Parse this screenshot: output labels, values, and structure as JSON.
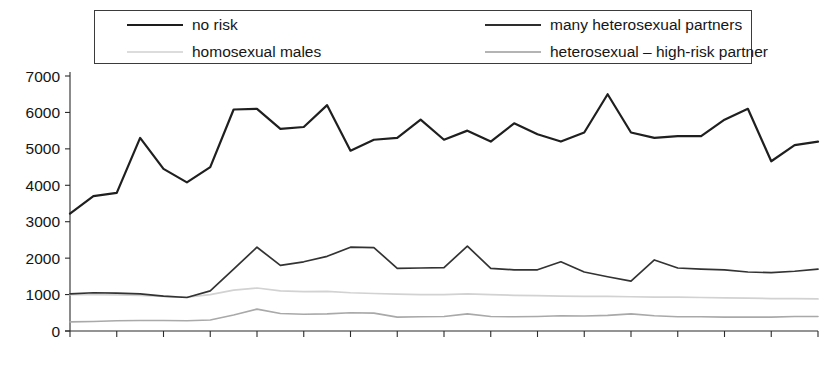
{
  "legend": {
    "items": [
      {
        "label": "no risk",
        "key": "no_risk",
        "color": "#1f1f1f"
      },
      {
        "label": "many heterosexual partners",
        "key": "many_het",
        "color": "#333333"
      },
      {
        "label": "homosexual males",
        "key": "homosexual_males",
        "color": "#d2d2d2"
      },
      {
        "label": "heterosexual – high-risk partner",
        "key": "het_high_risk",
        "color": "#a9a9a9"
      }
    ]
  },
  "chart_data": {
    "type": "line",
    "title": "",
    "xlabel": "",
    "ylabel": "",
    "ylim": [
      0,
      7000
    ],
    "ytick_labels": [
      "0",
      "1000",
      "2000",
      "3000",
      "4000",
      "5000",
      "6000",
      "7000"
    ],
    "yticks": [
      0,
      1000,
      2000,
      3000,
      4000,
      5000,
      6000,
      7000
    ],
    "grid": false,
    "legend_position": "top",
    "categories": [
      "2 89",
      "3 89",
      "4 89",
      "1 90",
      "2 90",
      "3 90",
      "4 90",
      "1 91",
      "2 91",
      "3 91",
      "4 91",
      "1 92",
      "2 92",
      "3 92",
      "4 92",
      "1 93",
      "2 93",
      "3 93",
      "4 93",
      "1 94",
      "2 94",
      "3 94",
      "4 94",
      "1 95",
      "2 95",
      "3 95",
      "4 95",
      "1 96",
      "2 96",
      "3 96",
      "4 96",
      "1 97",
      "2 97"
    ],
    "xtick_labels": [
      "2 89",
      "",
      "4 89",
      "",
      "2 90",
      "",
      "4 90",
      "",
      "2 91",
      "",
      "4 91",
      "",
      "2 92",
      "",
      "4 92",
      "",
      "2 93",
      "",
      "4 93",
      "",
      "2 94",
      "",
      "4 94",
      "",
      "2 95",
      "",
      "4 95",
      "",
      "2 96",
      "",
      "4 96",
      "",
      "2 97"
    ],
    "series": [
      {
        "name": "no risk",
        "color": "#1f1f1f",
        "values": [
          3220,
          3700,
          3790,
          5300,
          4450,
          4080,
          4500,
          6080,
          6100,
          5550,
          5600,
          6200,
          4950,
          5250,
          5300,
          5800,
          5250,
          5500,
          5200,
          5700,
          5400,
          5200,
          5450,
          6500,
          5450,
          5300,
          5350,
          5350,
          5800,
          6100,
          4660,
          5100,
          5200
        ]
      },
      {
        "name": "many heterosexual partners",
        "color": "#333333",
        "values": [
          1020,
          1050,
          1040,
          1020,
          960,
          920,
          1100,
          1700,
          2300,
          1800,
          1900,
          2050,
          2300,
          2290,
          1720,
          1730,
          1740,
          2330,
          1720,
          1680,
          1680,
          1900,
          1620,
          1490,
          1370,
          1950,
          1730,
          1700,
          1680,
          1620,
          1600,
          1640,
          1700
        ]
      },
      {
        "name": "homosexual males",
        "color": "#d2d2d2",
        "values": [
          1000,
          1000,
          990,
          980,
          950,
          930,
          1000,
          1120,
          1180,
          1100,
          1080,
          1090,
          1050,
          1030,
          1010,
          1000,
          1000,
          1020,
          1000,
          980,
          970,
          960,
          950,
          950,
          940,
          930,
          930,
          920,
          910,
          900,
          890,
          890,
          880
        ]
      },
      {
        "name": "heterosexual – high-risk partner",
        "color": "#a9a9a9",
        "values": [
          250,
          260,
          280,
          290,
          290,
          280,
          300,
          440,
          600,
          480,
          460,
          470,
          500,
          490,
          380,
          390,
          400,
          470,
          400,
          390,
          400,
          420,
          410,
          430,
          470,
          420,
          390,
          390,
          380,
          380,
          380,
          400,
          400
        ]
      }
    ]
  }
}
